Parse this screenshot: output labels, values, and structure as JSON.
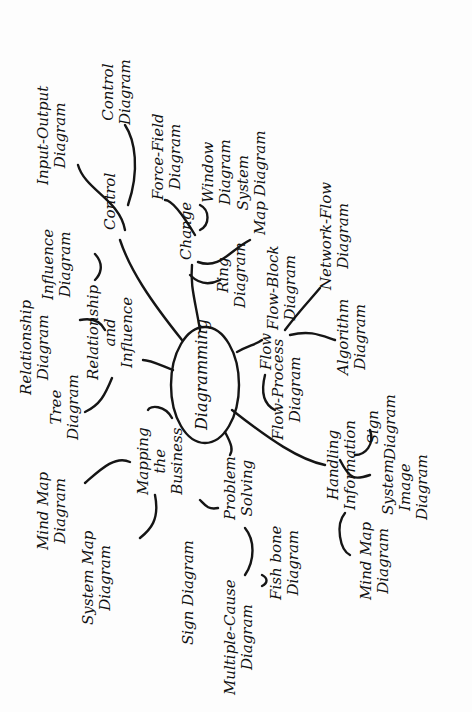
{
  "diagram": {
    "type": "mind-map",
    "orientation": "rotated 90 degrees counter-clockwise",
    "center": "Diagramming",
    "branches": [
      {
        "label": "Control",
        "children": [
          "Input-Output Diagram",
          "Control Diagram"
        ]
      },
      {
        "label": "Change",
        "children": [
          "Force-Field Diagram",
          "Window Diagram",
          "System Map Diagram",
          "Ring Diagram"
        ]
      },
      {
        "label": "Flow",
        "children": [
          "Flow-Block Diagram",
          "Network-flow Diagram",
          "Algorithm Diagram",
          "Flow-Process Diagram"
        ]
      },
      {
        "label": "Handling Information",
        "children": [
          "Sign Diagram",
          "System Image Diagram",
          "Mind Map Diagram"
        ]
      },
      {
        "label": "Problem Solving",
        "children": [
          "Sign Diagram",
          "Multiple-Cause Diagram",
          "Fish bone Diagram"
        ]
      },
      {
        "label": "Mapping the Business",
        "children": [
          "Mind Map Diagram",
          "System Map Diagram"
        ]
      },
      {
        "label": "Relationship and Influence",
        "children": [
          "Relationship Diagram",
          "Influence Diagram",
          "Tree Diagram"
        ]
      }
    ]
  },
  "labels": {
    "center": "Diagramming",
    "input_output": "Input-Output\nDiagram",
    "control_diagram": "Control\nDiagram",
    "control": "Control",
    "force_field": "Force-Field\nDiagram",
    "window": "Window\nDiagram",
    "system_map_top": "System\nMap Diagram",
    "change": "Change",
    "ring": "Ring\nDiagram",
    "flow_block": "Flow-Block\nDiagram",
    "network_flow": "Network-Flow\nDiagram",
    "flow": "Flow",
    "flow_process": "Flow-Process\nDiagram",
    "algorithm": "Algorithm\nDiagram",
    "relationship_diagram": "Relationship\nDiagram",
    "influence_diagram": "Influence\nDiagram",
    "relationship_influence": "Relationship\nand\nInfluence",
    "tree": "Tree\nDiagram",
    "mapping": "Mapping\nthe\nBusiness",
    "mind_map_left": "Mind Map\nDiagram",
    "system_map_left": "System Map\nDiagram",
    "problem_solving": "Problem\nSolving",
    "sign_left": "Sign Diagram",
    "multiple_cause": "Multiple-Cause\nDiagram",
    "fish_bone": "Fish bone\nDiagram",
    "handling": "Handling\nInformation",
    "sign_right": "Sign\nDiagram",
    "system_image": "System\nImage\nDiagram",
    "mind_map_right": "Mind Map\nDiagram"
  }
}
